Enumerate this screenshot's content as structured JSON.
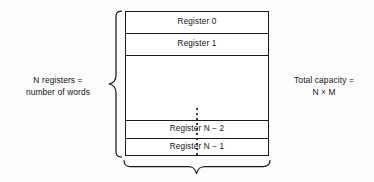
{
  "diagram": {
    "background_color": "#fcfcfc",
    "line_color": "#1a1a1a",
    "text_color": "#141414"
  },
  "register_stack": {
    "rows": [
      {
        "label": "Register 0",
        "name": "register-row-0"
      },
      {
        "label": "Register 1",
        "name": "register-row-1"
      },
      {
        "label": "",
        "name": "register-row-ellipsis"
      },
      {
        "label": "Register N − 2",
        "name": "register-row-n-minus-2"
      },
      {
        "label": "Register N − 1",
        "name": "register-row-n-minus-1"
      }
    ],
    "ellipsis_style": "vertical-dotted-line"
  },
  "annotations": {
    "left": {
      "line1": "N registers =",
      "line2": "number of words",
      "brace": "left-curly-brace"
    },
    "right": {
      "line1": "Total capacity =",
      "line2": "N × M"
    },
    "bottom": {
      "brace": "bottom-curly-brace",
      "label": ""
    }
  }
}
